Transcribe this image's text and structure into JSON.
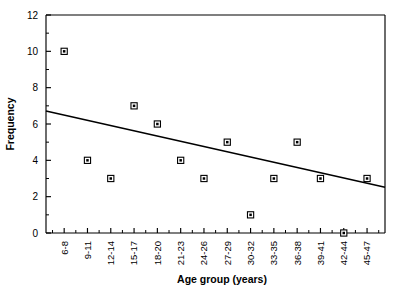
{
  "chart_data": {
    "type": "scatter",
    "title": "",
    "xlabel": "Age group (years)",
    "ylabel": "Frequency",
    "categories": [
      "6-8",
      "9-11",
      "12-14",
      "15-17",
      "18-20",
      "21-23",
      "24-26",
      "27-29",
      "30-32",
      "33-35",
      "36-38",
      "39-41",
      "42-44",
      "45-47"
    ],
    "values": [
      10,
      4,
      3,
      7,
      6,
      4,
      3,
      5,
      1,
      3,
      5,
      3,
      0,
      3
    ],
    "series": [
      {
        "name": "Frequency",
        "values": [
          10,
          4,
          3,
          7,
          6,
          4,
          3,
          5,
          1,
          3,
          5,
          3,
          0,
          3
        ]
      }
    ],
    "ylim": [
      0,
      12
    ],
    "y_ticks": [
      0,
      2,
      4,
      6,
      8,
      10,
      12
    ],
    "y_tick_labels": [
      "0",
      "2",
      "4",
      "6",
      "8",
      "10",
      "12"
    ],
    "y_minor_step": 1,
    "grid": false,
    "legend": "none",
    "trendline": {
      "type": "linear",
      "start_value": 6.72,
      "end_value": 2.52,
      "description": "declining linear regression line"
    },
    "marker": {
      "shape": "square-with-dot",
      "color": "#000000",
      "fill": "#ffffff"
    },
    "x_tick_label_rotation": -90
  }
}
